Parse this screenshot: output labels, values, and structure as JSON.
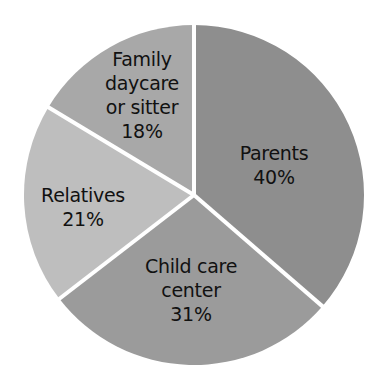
{
  "chart_data": {
    "type": "pie",
    "title": "",
    "start_angle_deg": 0,
    "direction": "clockwise",
    "labels_inside": true,
    "legend": "none",
    "note": "Printed percentages sum to 110%",
    "slices": [
      {
        "label": "Parents",
        "label_lines": [
          "Parents",
          "40%"
        ],
        "value": 40,
        "color": "#8e8e8e"
      },
      {
        "label": "Child care center",
        "label_lines": [
          "Child care",
          "center",
          "31%"
        ],
        "value": 31,
        "color": "#9b9b9b"
      },
      {
        "label": "Relatives",
        "label_lines": [
          "Relatives",
          "21%"
        ],
        "value": 21,
        "color": "#bebebe"
      },
      {
        "label": "Family daycare or sitter",
        "label_lines": [
          "Family",
          "daycare",
          "or sitter",
          "18%"
        ],
        "value": 18,
        "color": "#a8a8a8"
      }
    ]
  },
  "labels": {
    "parents": {
      "line1": "Parents",
      "line2": "40%"
    },
    "child_care": {
      "line1": "Child care",
      "line2": "center",
      "line3": "31%"
    },
    "relatives": {
      "line1": "Relatives",
      "line2": "21%"
    },
    "family": {
      "line1": "Family",
      "line2": "daycare",
      "line3": "or sitter",
      "line4": "18%"
    }
  }
}
